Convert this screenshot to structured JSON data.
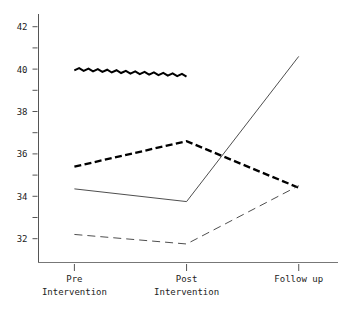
{
  "chart_data": {
    "type": "line",
    "title": "",
    "subtitle": "",
    "xlabel": "",
    "ylabel": "",
    "categories": [
      "Pre Intervention",
      "Post Intervention",
      "Follow up"
    ],
    "x": [
      0,
      1,
      2
    ],
    "ylim": [
      30.9,
      42.6
    ],
    "xlim": [
      -0.32,
      2.35
    ],
    "grid": false,
    "legend": "none",
    "y_major_ticks": [
      32,
      34,
      36,
      38,
      40,
      42
    ],
    "y_major_tick_labels": [
      "32",
      "34",
      "36",
      "38",
      "40",
      "42"
    ],
    "y_minor_ticks": [
      33,
      35,
      37,
      39,
      41
    ],
    "x_ticks": [
      0,
      1,
      2
    ],
    "series": [
      {
        "name": "wavy-thick-series",
        "style": "wavy-thick",
        "color": "#000000",
        "x": [
          0,
          1
        ],
        "values": [
          40.0,
          39.7
        ]
      },
      {
        "name": "thick-dashed-series",
        "style": "thick-dashed",
        "color": "#000000",
        "x": [
          0,
          1,
          2
        ],
        "values": [
          35.4,
          36.6,
          34.4
        ]
      },
      {
        "name": "thin-solid-series",
        "style": "thin-solid",
        "color": "#3a3a3a",
        "x": [
          0,
          1,
          2
        ],
        "values": [
          34.35,
          33.75,
          40.6
        ]
      },
      {
        "name": "thin-long-dashed-series",
        "style": "thin-long-dashed",
        "color": "#3a3a3a",
        "x": [
          0,
          1,
          2
        ],
        "values": [
          32.2,
          31.75,
          34.5
        ]
      }
    ]
  },
  "axes": {
    "y_labels": [
      "42",
      "40",
      "38",
      "36",
      "34",
      "32"
    ],
    "x_labels": [
      {
        "line1": "Pre",
        "line2": "Intervention"
      },
      {
        "line1": "Post",
        "line2": "Intervention"
      },
      {
        "line1": "Follow up",
        "line2": ""
      }
    ]
  },
  "caption": {
    "ghost_text": ""
  }
}
